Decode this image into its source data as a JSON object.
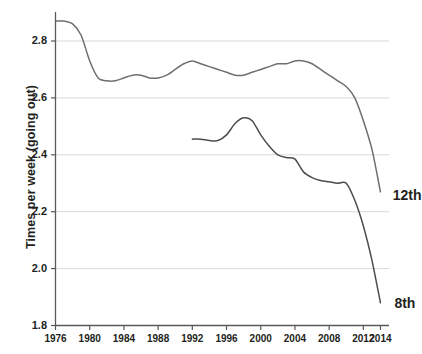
{
  "chart_data": {
    "type": "line",
    "title": "",
    "xlabel": "",
    "ylabel": "Times per week (going out)",
    "xlim": [
      1976,
      2015
    ],
    "ylim": [
      1.8,
      2.88
    ],
    "grid": "horizontal",
    "legend_position": "inline-right-end-of-line",
    "yticks": [
      "1.8",
      "2.0",
      "2.2",
      "2.4",
      "2.6",
      "2.8"
    ],
    "ytick_values": [
      1.8,
      2.0,
      2.2,
      2.4,
      2.6,
      2.8
    ],
    "xticks": [
      "1976",
      "1980",
      "1984",
      "1988",
      "1992",
      "1996",
      "2000",
      "2004",
      "2008",
      "2012",
      "2014"
    ],
    "xtick_values": [
      1976,
      1980,
      1984,
      1988,
      1992,
      1996,
      2000,
      2004,
      2008,
      2012,
      2014
    ],
    "series": [
      {
        "name": "12th",
        "label": "12th",
        "color": "#6e6e6e",
        "x": [
          1976,
          1977,
          1978,
          1979,
          1980,
          1981,
          1982,
          1983,
          1984,
          1985,
          1986,
          1987,
          1988,
          1989,
          1990,
          1991,
          1992,
          1993,
          1994,
          1995,
          1996,
          1997,
          1998,
          1999,
          2000,
          2001,
          2002,
          2003,
          2004,
          2005,
          2006,
          2007,
          2008,
          2009,
          2010,
          2011,
          2012,
          2013,
          2014
        ],
        "values": [
          2.87,
          2.87,
          2.86,
          2.82,
          2.73,
          2.67,
          2.66,
          2.66,
          2.67,
          2.68,
          2.68,
          2.67,
          2.67,
          2.68,
          2.7,
          2.72,
          2.73,
          2.72,
          2.71,
          2.7,
          2.69,
          2.68,
          2.68,
          2.69,
          2.7,
          2.71,
          2.72,
          2.72,
          2.73,
          2.73,
          2.72,
          2.7,
          2.68,
          2.66,
          2.64,
          2.6,
          2.52,
          2.42,
          2.27
        ]
      },
      {
        "name": "8th",
        "label": "8th",
        "color": "#4d4d4d",
        "x": [
          1992,
          1993,
          1994,
          1995,
          1996,
          1997,
          1998,
          1999,
          2000,
          2001,
          2002,
          2003,
          2004,
          2005,
          2006,
          2007,
          2008,
          2009,
          2010,
          2011,
          2012,
          2013,
          2014
        ],
        "values": [
          2.455,
          2.455,
          2.45,
          2.45,
          2.47,
          2.51,
          2.53,
          2.52,
          2.47,
          2.43,
          2.4,
          2.39,
          2.385,
          2.34,
          2.32,
          2.31,
          2.305,
          2.3,
          2.3,
          2.24,
          2.15,
          2.03,
          1.88
        ]
      }
    ],
    "annotations": [
      {
        "text": "12th",
        "x": 2015.2,
        "y": 2.255
      },
      {
        "text": "8th",
        "x": 2015.4,
        "y": 1.875
      }
    ]
  }
}
